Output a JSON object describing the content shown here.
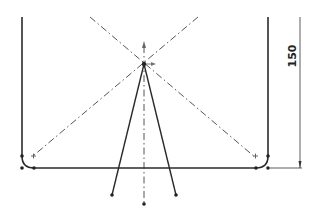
{
  "sketch": {
    "colors": {
      "geometry": "#2a2a2a",
      "centerline": "#555555",
      "dimension": "#333333",
      "background": "#ffffff"
    },
    "dimension": {
      "value": "150",
      "orientation": "vertical"
    },
    "geometry": {
      "left_wall": {
        "x": 22,
        "y1": 17,
        "y2": 156
      },
      "right_wall": {
        "x": 268,
        "y1": 17,
        "y2": 156
      },
      "bottom_line": {
        "x1": 34,
        "x2": 256,
        "y": 168
      },
      "fillet_radius": 12,
      "apex": {
        "x": 144,
        "y": 64
      },
      "leg_left_end": {
        "x": 112,
        "y": 195
      },
      "leg_right_end": {
        "x": 176,
        "y": 195
      },
      "axis_bottom": {
        "x": 144,
        "y": 204
      }
    },
    "icons": [
      "sketch-point",
      "origin-arrow",
      "centerline",
      "dimension-arrow"
    ]
  }
}
